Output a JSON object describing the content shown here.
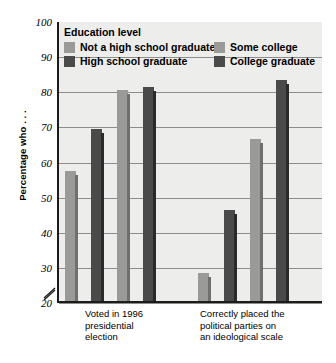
{
  "chart_data": {
    "type": "bar",
    "title": "",
    "xlabel": "",
    "ylabel": "Percentage who . . .",
    "ylim": [
      20,
      100
    ],
    "yticks": [
      100,
      90,
      80,
      70,
      60,
      50,
      40,
      30,
      20
    ],
    "grid": true,
    "axis_break": true,
    "legend_position": "top-inside",
    "legend_title": "Education level",
    "categories": [
      "Voted in 1996 presidential election",
      "Correctly placed the political parties on an ideological scale"
    ],
    "series": [
      {
        "name": "Not a high school graduate",
        "color": "#9a9a98",
        "values": [
          57,
          28
        ]
      },
      {
        "name": "High school graduate",
        "color": "#4a4a4a",
        "values": [
          69,
          46
        ]
      },
      {
        "name": "Some college",
        "color": "#9a9a98",
        "values": [
          80,
          66
        ]
      },
      {
        "name": "College graduate",
        "color": "#4a4a4a",
        "values": [
          81,
          83
        ]
      }
    ]
  },
  "legend": {
    "title": "Education level",
    "entries": [
      {
        "label": "Not a high school graduate",
        "color": "#9a9a98"
      },
      {
        "label": "Some college",
        "color": "#9a9a98"
      },
      {
        "label": "High school graduate",
        "color": "#4a4a4a"
      },
      {
        "label": "College graduate",
        "color": "#4a4a4a"
      }
    ]
  },
  "axis": {
    "y_title": "Percentage who . . .",
    "y_ticks": [
      "100",
      "90",
      "80",
      "70",
      "60",
      "50",
      "40",
      "30",
      "20"
    ]
  },
  "category_labels": [
    "Voted in 1996\npresidential\nelection",
    "Correctly placed the\npolitical parties on\nan ideological scale"
  ],
  "colors": {
    "light_bar": "#9a9a98",
    "light_bar_side": "#6f6f6e",
    "dark_bar": "#4a4a4a",
    "dark_bar_side": "#2a2a2a",
    "plot_background": "#ededeb",
    "gridline": "#8d8d8d",
    "axis": "#1c1c1c"
  }
}
